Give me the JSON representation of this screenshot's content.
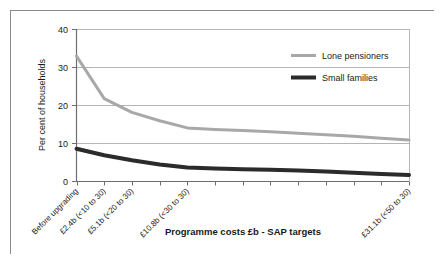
{
  "chart_data": {
    "type": "line",
    "title": "",
    "subtitle": "",
    "xlabel": "Programme costs £b - SAP targets",
    "ylabel": "Per cent of households",
    "ylim": [
      0,
      40
    ],
    "yticks": [
      0,
      10,
      20,
      30,
      40
    ],
    "ytick_labels": [
      "0",
      "10",
      "20",
      "30",
      "40"
    ],
    "grid": "horizontal",
    "legend_position": "upper-right-inside",
    "x_index": [
      0,
      1,
      2,
      3,
      4,
      5,
      6,
      7,
      8,
      9,
      10,
      11,
      12
    ],
    "categories": [
      "Before upgrading",
      "£2.4b (<10 to 30)",
      "£5.1b (<20 to 30)",
      "",
      "£10.8b (<30 to 30)",
      "",
      "",
      "",
      "",
      "",
      "",
      "",
      "£31.1b (<50 to 30)"
    ],
    "visible_category_labels": [
      {
        "index": 0,
        "label": "Before upgrading"
      },
      {
        "index": 1,
        "label": "£2.4b (<10 to 30)"
      },
      {
        "index": 2,
        "label": "£5.1b (<20 to 30)"
      },
      {
        "index": 4,
        "label": "£10.8b (<30 to 30)"
      },
      {
        "index": 12,
        "label": "£31.1b (<50 to 30)"
      }
    ],
    "series": [
      {
        "name": "Lone pensioners",
        "color": "#a8a8a8",
        "values": [
          33.0,
          21.8,
          18.2,
          16.0,
          14.1,
          13.7,
          13.4,
          13.1,
          12.7,
          12.3,
          11.9,
          11.4,
          10.9
        ]
      },
      {
        "name": "Small families",
        "color": "#2b2b2b",
        "values": [
          8.6,
          6.9,
          5.6,
          4.5,
          3.7,
          3.4,
          3.2,
          3.1,
          2.9,
          2.6,
          2.3,
          2.0,
          1.7
        ]
      }
    ]
  },
  "legend": {
    "items": [
      {
        "label": "Lone pensioners",
        "color": "#a8a8a8"
      },
      {
        "label": "Small families",
        "color": "#2b2b2b"
      }
    ]
  },
  "axes": {
    "y_title": "Per cent of households",
    "x_title": "Programme costs £b - SAP targets",
    "y_tick_0": "0",
    "y_tick_1": "10",
    "y_tick_2": "20",
    "y_tick_3": "30",
    "y_tick_4": "40"
  },
  "colors": {
    "border": "#8a8a8a",
    "axis": "#6e6e6e",
    "grid": "#b5b5b5",
    "background": "#ffffff",
    "series_light": "#a8a8a8",
    "series_dark": "#2b2b2b",
    "text": "#1a1a1a"
  }
}
